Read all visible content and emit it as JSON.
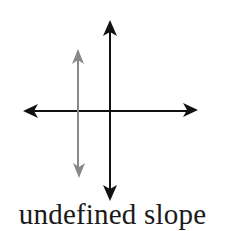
{
  "caption": "undefined slope",
  "colors": {
    "axes": "#111111",
    "line": "#888888",
    "background": "#ffffff"
  },
  "diagram": {
    "axes": {
      "horizontal": {
        "x1": 23,
        "x2": 198,
        "y": 111
      },
      "vertical": {
        "x": 110,
        "y1": 20,
        "y2": 201
      }
    },
    "vertical_line": {
      "x": 78,
      "y1": 49,
      "y2": 178,
      "description": "vertical line with undefined slope"
    }
  }
}
